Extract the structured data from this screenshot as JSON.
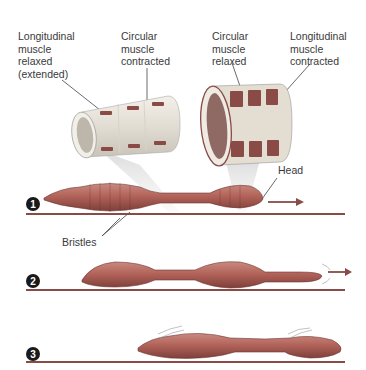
{
  "labels": {
    "top_left_1": "Longitudinal\nmuscle\nrelaxed\n(extended)",
    "top_left_2": "Circular\nmuscle\ncontracted",
    "top_right_1": "Circular\nmuscle\nrelaxed",
    "top_right_2": "Longitudinal\nmuscle\ncontracted",
    "head": "Head",
    "bristles": "Bristles"
  },
  "steps": [
    {
      "number": "1"
    },
    {
      "number": "2"
    },
    {
      "number": "3"
    }
  ],
  "colors": {
    "worm": "#b3645a",
    "worm_dark": "#7e3f3a",
    "ground": "#8a4b47",
    "band_dark": "#8a4b47",
    "cylinder_light": "#e8e3da",
    "arrow": "#8a4b47",
    "badge": "#1a1a1a"
  }
}
